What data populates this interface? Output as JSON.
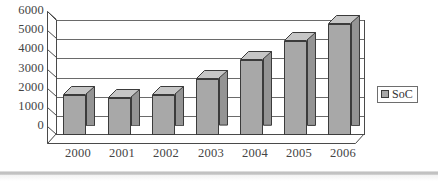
{
  "chart_data": {
    "type": "bar",
    "title": "",
    "subtitle": "",
    "xlabel": "",
    "ylabel": "",
    "categories": [
      "2000",
      "2001",
      "2002",
      "2003",
      "2004",
      "2005",
      "2006"
    ],
    "series": [
      {
        "name": "SoC",
        "values": [
          2100,
          1950,
          2100,
          2900,
          3900,
          4900,
          5800
        ],
        "color": "#a8a8a8"
      }
    ],
    "ylim": [
      0,
      6000
    ],
    "yticks": [
      "0",
      "1000",
      "2000",
      "3000",
      "4000",
      "5000",
      "6000"
    ],
    "ytick_values": [
      0,
      1000,
      2000,
      3000,
      4000,
      5000,
      6000
    ],
    "grid": true,
    "grid_axis": "y",
    "legend_position": "right",
    "style": "3d-column",
    "bar_color": "#a8a8a8",
    "bar_border_color": "#3b3b3b",
    "axis_color": "#4a4a4a",
    "grid_color": "#6a6a6a",
    "text_color": "#444444",
    "background": "#ffffff"
  },
  "legend": {
    "entries": [
      {
        "label": "SoC",
        "swatch_color": "#a8a8a8"
      }
    ]
  },
  "footer": {
    "separator_color": "#b9b9b9"
  }
}
